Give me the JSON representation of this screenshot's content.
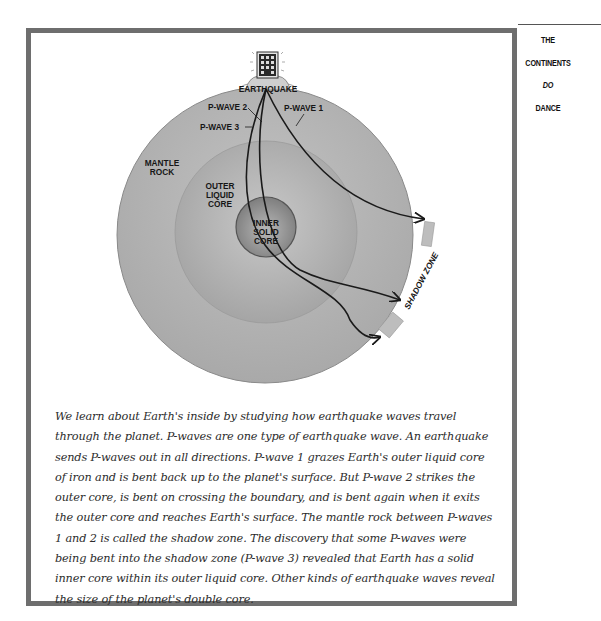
{
  "side_title": {
    "lines": [
      "THE",
      "CONTINENTS",
      "DO",
      "DANCE"
    ]
  },
  "diagram": {
    "labels": {
      "earthquake": "EARTHQUAKE",
      "p_wave_1": "P-WAVE 1",
      "p_wave_2": "P-WAVE 2",
      "p_wave_3": "P-WAVE 3",
      "mantle_line1": "MANTLE",
      "mantle_line2": "ROCK",
      "outer_core_line1": "OUTER",
      "outer_core_line2": "LIQUID",
      "outer_core_line3": "CORE",
      "inner_core_line1": "INNER",
      "inner_core_line2": "SOLID",
      "inner_core_line3": "CORE",
      "shadow_zone": "SHADOW ZONE"
    },
    "colors": {
      "frame": "#6e6e6e",
      "mantle": "#b4b4b4",
      "outer_core": "#a8a8a8",
      "inner_core": "#8e8e8e",
      "wave_line": "#1a1a1a"
    }
  },
  "caption": {
    "text": "We learn about Earth's inside by studying how earthquake waves travel through the planet. P-waves are one type of earthquake wave. An earthquake sends P-waves out in all directions. P-wave 1 grazes Earth's outer liquid core of iron and is bent back up to the planet's surface. But P-wave 2 strikes the outer core, is bent on crossing the boundary, and is bent again when it exits the outer core and reaches Earth's surface. The mantle rock between P-waves 1 and 2 is called the shadow zone. The discovery that some P-waves were being bent into the shadow zone (P-wave 3) revealed that Earth has a solid inner core within its outer liquid core. Other kinds of earthquake waves reveal the size of the planet's double core."
  }
}
